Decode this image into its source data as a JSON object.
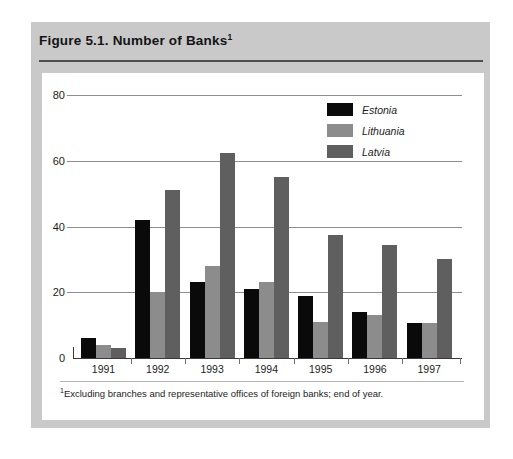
{
  "figure": {
    "title": "Figure 5.1.  Number of Banks",
    "title_footnote_marker": "1",
    "footnote_marker": "1",
    "footnote": "Excluding branches and representative offices of foreign banks; end of year."
  },
  "legend": {
    "position": "top-right",
    "entries": [
      {
        "label": "Estonia",
        "color": "#0a0a0a"
      },
      {
        "label": "Lithuania",
        "color": "#8c8c8c"
      },
      {
        "label": "Latvia",
        "color": "#5f5f5f"
      }
    ]
  },
  "axis": {
    "y_ticks": [
      "0",
      "20",
      "40",
      "60",
      "80"
    ],
    "x_ticks": [
      "1991",
      "1992",
      "1993",
      "1994",
      "1995",
      "1996",
      "1997"
    ]
  },
  "chart_data": {
    "type": "bar",
    "title": "Figure 5.1. Number of Banks",
    "subtitle": "",
    "xlabel": "",
    "ylabel": "",
    "categories": [
      "1991",
      "1992",
      "1993",
      "1994",
      "1995",
      "1996",
      "1997"
    ],
    "series": [
      {
        "name": "Estonia",
        "color": "#0a0a0a",
        "values": [
          6,
          42,
          23,
          21,
          19,
          14,
          10.5
        ]
      },
      {
        "name": "Lithuania",
        "color": "#8c8c8c",
        "values": [
          4,
          20,
          28,
          23,
          11,
          13,
          10.5
        ]
      },
      {
        "name": "Latvia",
        "color": "#5f5f5f",
        "values": [
          3,
          51,
          62.5,
          55,
          37.5,
          34.5,
          30
        ]
      }
    ],
    "ylim": [
      0,
      80
    ],
    "yticks": [
      0,
      20,
      40,
      60,
      80
    ],
    "grid": "horizontal",
    "legend_position": "top-right",
    "annotations": [
      "Excluding branches and representative offices of foreign banks; end of year."
    ]
  }
}
